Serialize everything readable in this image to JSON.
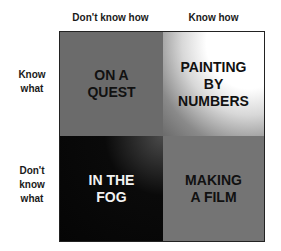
{
  "columns": [
    {
      "label": "Don't know how"
    },
    {
      "label": "Know how"
    }
  ],
  "rows": [
    {
      "label_lines": [
        "Know",
        "what"
      ]
    },
    {
      "label_lines": [
        "Don't",
        "know",
        "what"
      ]
    }
  ],
  "cells": {
    "top_left": {
      "lines": [
        "ON A",
        "QUEST"
      ],
      "color": "#6b6b6b"
    },
    "top_right": {
      "lines": [
        "PAINTING",
        "BY",
        "NUMBERS"
      ],
      "color": "#ffffff"
    },
    "bottom_left": {
      "lines": [
        "IN THE",
        "FOG"
      ],
      "color": "#050505"
    },
    "bottom_right": {
      "lines": [
        "MAKING",
        "A FILM"
      ],
      "color": "#747474"
    }
  }
}
